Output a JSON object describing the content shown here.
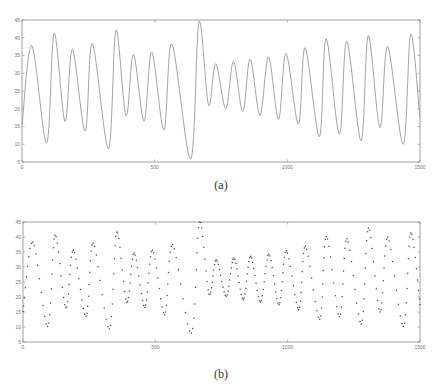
{
  "chart_data": [
    {
      "id": "a",
      "type": "line",
      "caption": "(a)",
      "title": "",
      "xlabel": "",
      "ylabel": "",
      "xlim": [
        0,
        1500
      ],
      "ylim": [
        5,
        45
      ],
      "xticks": [
        0,
        500,
        1000,
        1500
      ],
      "yticks": [
        5,
        10,
        15,
        20,
        25,
        30,
        35,
        40,
        45
      ],
      "grid": false,
      "legend": null,
      "style": {
        "color": "#9a9a9a",
        "marker": "none",
        "linewidth": 0.8
      },
      "x": [
        0,
        37,
        93,
        121,
        162,
        190,
        238,
        265,
        326,
        354,
        392,
        420,
        460,
        489,
        535,
        565,
        636,
        667,
        703,
        730,
        768,
        797,
        832,
        860,
        897,
        929,
        967,
        995,
        1042,
        1067,
        1121,
        1146,
        1196,
        1224,
        1278,
        1305,
        1349,
        1378,
        1437,
        1465,
        1500
      ],
      "values": [
        15.4,
        37.8,
        10.3,
        41.3,
        16.4,
        36.7,
        13.7,
        38.4,
        8.7,
        42.2,
        18.0,
        35.3,
        16.5,
        36.0,
        14.0,
        38.2,
        5.8,
        44.5,
        21.0,
        32.7,
        20.0,
        33.3,
        19.2,
        34.0,
        18.2,
        34.6,
        17.0,
        35.6,
        15.6,
        37.2,
        12.1,
        39.8,
        12.8,
        39.0,
        10.9,
        40.6,
        14.7,
        37.5,
        10.0,
        41.0,
        17.3
      ]
    },
    {
      "id": "b",
      "type": "scatter",
      "caption": "(b)",
      "title": "",
      "xlabel": "",
      "ylabel": "",
      "xlim": [
        0,
        1500
      ],
      "ylim": [
        5,
        45
      ],
      "xticks": [
        0,
        500,
        1000,
        1500
      ],
      "yticks": [
        5,
        10,
        15,
        20,
        25,
        30,
        35,
        40,
        45
      ],
      "grid": false,
      "legend": null,
      "style": {
        "color": "#4a4a4a",
        "marker": "dot",
        "linewidth": 0
      },
      "x": [
        0,
        37,
        93,
        121,
        162,
        190,
        238,
        265,
        326,
        354,
        392,
        420,
        460,
        489,
        535,
        565,
        636,
        667,
        703,
        730,
        768,
        797,
        832,
        860,
        897,
        929,
        967,
        995,
        1042,
        1067,
        1121,
        1146,
        1196,
        1224,
        1278,
        1305,
        1349,
        1378,
        1437,
        1465,
        1500
      ],
      "values": [
        15.2,
        38.3,
        10.2,
        40.6,
        16.3,
        35.6,
        13.6,
        38.0,
        9.3,
        41.7,
        18.2,
        34.7,
        16.6,
        35.6,
        14.1,
        37.4,
        8.0,
        45.0,
        21.0,
        32.4,
        20.2,
        33.0,
        19.1,
        33.6,
        18.3,
        34.3,
        17.4,
        35.4,
        15.8,
        36.9,
        12.6,
        40.2,
        13.4,
        39.4,
        11.0,
        43.0,
        15.0,
        39.9,
        10.2,
        41.3,
        17.4
      ]
    }
  ],
  "captions": {
    "a": "(a)",
    "b": "(b)"
  }
}
